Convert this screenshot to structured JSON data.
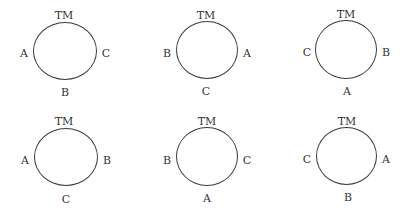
{
  "diagrams": [
    {
      "top": "TM",
      "left": "A",
      "right": "C",
      "bottom": "B"
    },
    {
      "top": "TM",
      "left": "B",
      "right": "A",
      "bottom": "C"
    },
    {
      "top": "TM",
      "left": "C",
      "right": "B",
      "bottom": "A"
    },
    {
      "top": "TM",
      "left": "A",
      "right": "B",
      "bottom": "C"
    },
    {
      "top": "TM",
      "left": "B",
      "right": "C",
      "bottom": "A"
    },
    {
      "top": "TM",
      "left": "C",
      "right": "A",
      "bottom": "B"
    }
  ]
}
